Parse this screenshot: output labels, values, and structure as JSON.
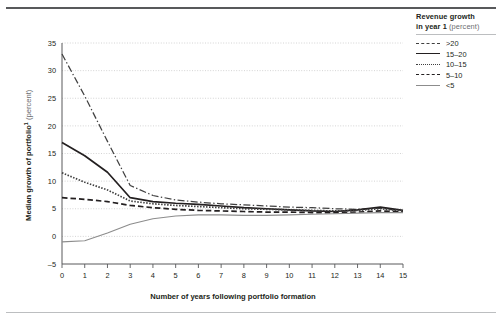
{
  "legend": {
    "title_line1": "Revenue growth",
    "title_line2": "in year 1",
    "title_unit": "(percent)",
    "items": [
      {
        "label": ">20",
        "style": "dash-dot"
      },
      {
        "label": "15–20",
        "style": "solid-dark"
      },
      {
        "label": "10–15",
        "style": "dotted"
      },
      {
        "label": "5–10",
        "style": "dashed"
      },
      {
        "label": "<5",
        "style": "solid-gray"
      }
    ]
  },
  "axes": {
    "y_title": "Median growth of portfolio",
    "y_title_footnote": "1",
    "y_unit": "(percent)",
    "x_title": "Number of years following portfolio formation",
    "y_ticks": [
      "35",
      "30",
      "25",
      "20",
      "15",
      "10",
      "5",
      "0",
      "–5"
    ],
    "x_ticks": [
      "0",
      "1",
      "2",
      "3",
      "4",
      "5",
      "6",
      "7",
      "8",
      "9",
      "10",
      "11",
      "12",
      "13",
      "14",
      "15"
    ]
  },
  "chart_data": {
    "type": "line",
    "title": "",
    "xlabel": "Number of years following portfolio formation",
    "ylabel": "Median growth of portfolio (percent)",
    "xlim": [
      0,
      15
    ],
    "ylim": [
      -5,
      35
    ],
    "grid": true,
    "legend_position": "right",
    "legend_title": "Revenue growth in year 1 (percent)",
    "x": [
      0,
      1,
      2,
      3,
      4,
      5,
      6,
      7,
      8,
      9,
      10,
      11,
      12,
      13,
      14,
      15
    ],
    "series": [
      {
        "name": ">20",
        "style": "dash-dot",
        "color": "#404040",
        "values": [
          33.0,
          25.4,
          17.2,
          9.2,
          7.4,
          6.6,
          6.2,
          5.9,
          5.7,
          5.5,
          5.3,
          5.2,
          5.0,
          4.9,
          5.1,
          4.6
        ]
      },
      {
        "name": "15–20",
        "style": "solid-dark",
        "color": "#231f20",
        "values": [
          17.0,
          14.6,
          11.6,
          7.0,
          6.3,
          6.0,
          5.8,
          5.5,
          5.2,
          5.0,
          4.8,
          4.6,
          4.5,
          4.8,
          5.3,
          4.7
        ]
      },
      {
        "name": "10–15",
        "style": "dotted",
        "color": "#404040",
        "values": [
          11.5,
          9.8,
          8.4,
          6.4,
          5.9,
          5.6,
          5.4,
          5.2,
          5.0,
          4.9,
          4.8,
          4.7,
          4.6,
          4.7,
          5.0,
          4.6
        ]
      },
      {
        "name": "5–10",
        "style": "dashed",
        "color": "#231f20",
        "values": [
          7.0,
          6.7,
          6.3,
          5.6,
          5.2,
          4.9,
          4.7,
          4.6,
          4.5,
          4.4,
          4.4,
          4.3,
          4.3,
          4.4,
          4.6,
          4.4
        ]
      },
      {
        "name": "<5",
        "style": "solid-gray",
        "color": "#8c8c8c",
        "values": [
          -1.0,
          -0.8,
          0.6,
          2.2,
          3.2,
          3.7,
          3.9,
          3.9,
          3.8,
          3.8,
          3.9,
          4.0,
          4.1,
          4.2,
          4.3,
          4.3
        ]
      }
    ]
  }
}
